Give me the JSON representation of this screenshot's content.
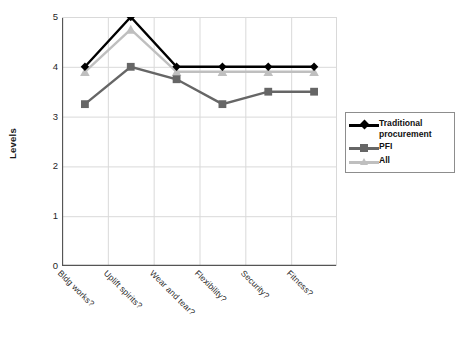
{
  "chart_data": {
    "type": "line",
    "title": "",
    "subtitle": "",
    "xlabel": "",
    "ylabel": "Levels",
    "ylim": [
      0,
      5
    ],
    "yticks": [
      0,
      1,
      2,
      3,
      4,
      5
    ],
    "ytick_labels": [
      "0",
      "1",
      "2",
      "3",
      "4",
      "5"
    ],
    "grid": true,
    "grid_axis": "both",
    "legend_position": "right-middle",
    "categories": [
      "Bldg works?",
      "Uplift spirits?",
      "Wear and tear?",
      "Flexibility?",
      "Security?",
      "Fitness?"
    ],
    "series": [
      {
        "name": "Traditional procurement",
        "legend_label": "Traditional\nprocurement",
        "color": "#000000",
        "marker": "diamond",
        "values": [
          4.0,
          5.0,
          4.0,
          4.0,
          4.0,
          4.0
        ]
      },
      {
        "name": "PFI",
        "legend_label": "PFI",
        "color": "#666666",
        "marker": "square",
        "values": [
          3.25,
          4.0,
          3.75,
          3.25,
          3.5,
          3.5
        ]
      },
      {
        "name": "All",
        "legend_label": "All",
        "color": "#bfbfbf",
        "marker": "triangle",
        "values": [
          3.9,
          4.75,
          3.9,
          3.9,
          3.9,
          3.9
        ]
      }
    ]
  },
  "legend": {
    "items": [
      {
        "label": "Traditional procurement",
        "color": "#000000",
        "marker": "diamond-icon"
      },
      {
        "label": "PFI",
        "color": "#666666",
        "marker": "square-icon"
      },
      {
        "label": "All",
        "color": "#bfbfbf",
        "marker": "triangle-icon"
      }
    ]
  },
  "axes": {
    "y_title": "Levels",
    "y_tick_labels": [
      "5",
      "4",
      "3",
      "2",
      "1",
      "0"
    ],
    "x_tick_labels": [
      "Bldg works?",
      "Uplift spirits?",
      "Wear and tear?",
      "Flexibility?",
      "Security?",
      "Fitness?"
    ]
  },
  "colors": {
    "axis": "#555555",
    "grid": "#d9d9d9",
    "plot_background": "#ffffff",
    "traditional": "#000000",
    "pfi": "#666666",
    "all": "#bfbfbf"
  }
}
